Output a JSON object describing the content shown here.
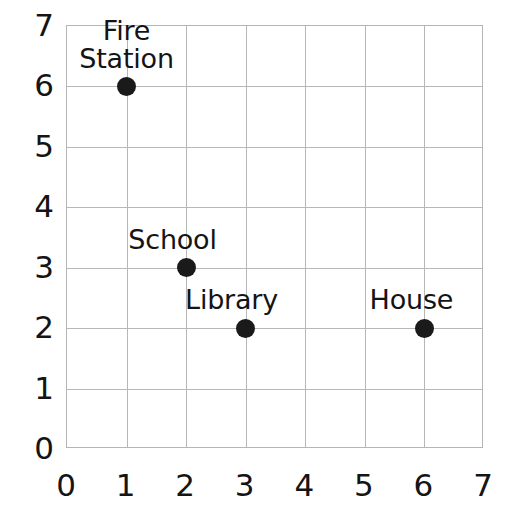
{
  "chart_data": {
    "type": "scatter",
    "title": "",
    "xlabel": "",
    "ylabel": "",
    "xlim": [
      0,
      7
    ],
    "ylim": [
      0,
      7
    ],
    "grid": true,
    "legend": "none",
    "x_ticks": [
      "0",
      "1",
      "2",
      "3",
      "4",
      "5",
      "6",
      "7"
    ],
    "y_ticks": [
      "0",
      "1",
      "2",
      "3",
      "4",
      "5",
      "6",
      "7"
    ],
    "points": [
      {
        "label": "Fire\nStation",
        "x": 1,
        "y": 6,
        "label_position": "above"
      },
      {
        "label": "School",
        "x": 2,
        "y": 3,
        "label_position": "above-left"
      },
      {
        "label": "Library",
        "x": 3,
        "y": 2,
        "label_position": "above-left"
      },
      {
        "label": "House",
        "x": 6,
        "y": 2,
        "label_position": "above-left"
      }
    ]
  },
  "style": {
    "point_color": "#1a1a1a",
    "grid_color": "#b7b7b7",
    "border_color": "#b5b5b5",
    "background": "#ffffff",
    "text_color": "#141414"
  }
}
